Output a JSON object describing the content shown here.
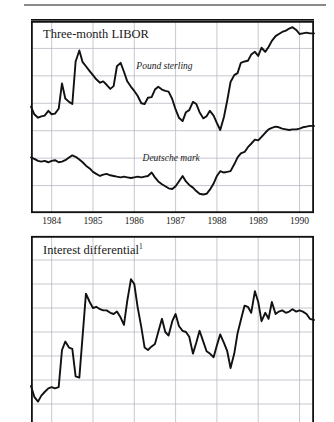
{
  "figure": {
    "rule_color": "#8a8a8a",
    "line_color": "#111111",
    "grid_color": "#b9b9c4",
    "frame_color": "#111111"
  },
  "chart_data": [
    {
      "type": "line",
      "title": "Three-month LIBOR",
      "xlabel": "",
      "ylabel": "",
      "grid": true,
      "legend_position": "inline-annotation",
      "ylim": [
        2,
        16
      ],
      "yticks": [
        2,
        4,
        6,
        8,
        10,
        12,
        14,
        16
      ],
      "ytick_labels": [
        "2",
        "4",
        "6",
        "8",
        "10",
        "12",
        "14",
        "16"
      ],
      "xlim": [
        1983.5,
        1990.35
      ],
      "xticks": [
        1984,
        1985,
        1986,
        1987,
        1988,
        1989,
        1990
      ],
      "xtick_labels": [
        "1984",
        "1985",
        "1986",
        "1987",
        "1988",
        "1989",
        "1990"
      ],
      "annotations": [
        {
          "text": "Pound sterling",
          "x": 1986.05,
          "y": 12.55
        },
        {
          "text": "Deutsche mark",
          "x": 1986.2,
          "y": 5.9
        }
      ],
      "series": [
        {
          "name": "Pound sterling",
          "x": [
            1983.5,
            1983.58,
            1983.67,
            1983.75,
            1983.83,
            1983.92,
            1984.0,
            1984.08,
            1984.17,
            1984.25,
            1984.33,
            1984.42,
            1984.5,
            1984.58,
            1984.67,
            1984.75,
            1984.83,
            1984.92,
            1985.0,
            1985.08,
            1985.17,
            1985.25,
            1985.33,
            1985.42,
            1985.5,
            1985.58,
            1985.67,
            1985.75,
            1985.83,
            1985.92,
            1986.0,
            1986.08,
            1986.17,
            1986.25,
            1986.33,
            1986.42,
            1986.5,
            1986.58,
            1986.67,
            1986.75,
            1986.83,
            1986.92,
            1987.0,
            1987.08,
            1987.17,
            1987.25,
            1987.33,
            1987.42,
            1987.5,
            1987.58,
            1987.67,
            1987.75,
            1987.83,
            1987.92,
            1988.0,
            1988.08,
            1988.17,
            1988.25,
            1988.33,
            1988.42,
            1988.5,
            1988.58,
            1988.67,
            1988.75,
            1988.83,
            1988.92,
            1989.0,
            1989.08,
            1989.17,
            1989.25,
            1989.33,
            1989.42,
            1989.5,
            1989.58,
            1989.67,
            1989.75,
            1989.83,
            1989.92,
            1990.0,
            1990.08,
            1990.17,
            1990.25,
            1990.35
          ],
          "y": [
            9.75,
            9.2,
            8.95,
            9.05,
            9.1,
            9.45,
            9.2,
            9.25,
            9.6,
            11.45,
            10.35,
            10.1,
            9.95,
            13.05,
            13.85,
            13.0,
            12.7,
            12.35,
            12.05,
            11.75,
            11.5,
            11.6,
            11.35,
            11.05,
            11.25,
            12.7,
            12.95,
            12.3,
            11.6,
            11.2,
            10.9,
            10.55,
            10.0,
            9.95,
            10.4,
            10.45,
            11.0,
            11.2,
            11.0,
            10.9,
            10.85,
            10.3,
            9.55,
            8.95,
            8.7,
            9.35,
            9.5,
            10.1,
            9.95,
            9.35,
            8.9,
            9.05,
            9.45,
            9.1,
            8.55,
            8.05,
            9.0,
            10.2,
            11.55,
            12.05,
            12.2,
            12.95,
            13.05,
            13.1,
            13.55,
            13.75,
            13.45,
            14.05,
            13.75,
            14.1,
            14.55,
            14.9,
            15.05,
            15.2,
            15.3,
            15.45,
            15.55,
            15.35,
            15.05,
            15.1,
            15.15,
            15.1,
            15.1
          ]
        },
        {
          "name": "Deutsche mark",
          "x": [
            1983.5,
            1983.58,
            1983.67,
            1983.75,
            1983.83,
            1983.92,
            1984.0,
            1984.08,
            1984.17,
            1984.25,
            1984.33,
            1984.42,
            1984.5,
            1984.58,
            1984.67,
            1984.75,
            1984.83,
            1984.92,
            1985.0,
            1985.08,
            1985.17,
            1985.25,
            1985.33,
            1985.42,
            1985.5,
            1985.58,
            1985.67,
            1985.75,
            1985.83,
            1985.92,
            1986.0,
            1986.08,
            1986.17,
            1986.25,
            1986.33,
            1986.42,
            1986.5,
            1986.58,
            1986.67,
            1986.75,
            1986.83,
            1986.92,
            1987.0,
            1987.08,
            1987.17,
            1987.25,
            1987.33,
            1987.42,
            1987.5,
            1987.58,
            1987.67,
            1987.75,
            1987.83,
            1987.92,
            1988.0,
            1988.08,
            1988.17,
            1988.25,
            1988.33,
            1988.42,
            1988.5,
            1988.58,
            1988.67,
            1988.75,
            1988.83,
            1988.92,
            1989.0,
            1989.08,
            1989.17,
            1989.25,
            1989.33,
            1989.42,
            1989.5,
            1989.58,
            1989.67,
            1989.75,
            1989.83,
            1989.92,
            1990.0,
            1990.08,
            1990.17,
            1990.25,
            1990.35
          ],
          "y": [
            6.05,
            5.95,
            5.8,
            5.75,
            5.8,
            5.7,
            5.8,
            5.85,
            5.7,
            5.75,
            5.85,
            6.05,
            6.2,
            6.1,
            5.9,
            5.7,
            5.45,
            5.25,
            5.0,
            4.85,
            4.7,
            4.8,
            4.85,
            4.75,
            4.7,
            4.65,
            4.6,
            4.65,
            4.6,
            4.55,
            4.6,
            4.65,
            4.6,
            4.65,
            4.7,
            4.95,
            4.6,
            4.3,
            4.1,
            3.95,
            3.8,
            3.75,
            3.95,
            4.3,
            4.7,
            4.3,
            4.05,
            3.85,
            3.6,
            3.4,
            3.35,
            3.4,
            3.7,
            4.15,
            4.7,
            5.05,
            4.95,
            5.0,
            5.05,
            5.55,
            6.05,
            6.35,
            6.45,
            6.8,
            7.05,
            7.35,
            7.3,
            7.55,
            7.85,
            8.1,
            8.2,
            8.3,
            8.25,
            8.15,
            8.1,
            8.05,
            8.1,
            8.1,
            8.15,
            8.25,
            8.3,
            8.35,
            8.35
          ]
        }
      ]
    },
    {
      "type": "line",
      "title": "Interest differential",
      "title_superscript": "1",
      "xlabel": "",
      "ylabel": "",
      "grid": true,
      "ylim": [
        2,
        10
      ],
      "yticks": [
        3,
        4,
        5,
        6,
        7,
        8,
        9,
        10
      ],
      "ytick_labels": [
        "3",
        "4",
        "5",
        "6",
        "7",
        "8",
        "9",
        "10"
      ],
      "xlim": [
        1983.5,
        1990.35
      ],
      "xticks": [
        1984,
        1985,
        1986,
        1987,
        1988,
        1989,
        1990
      ],
      "xtick_labels": [],
      "note": "bottom of panel is cropped by the screenshot edge",
      "series": [
        {
          "name": "Interest differential",
          "x": [
            1983.5,
            1983.58,
            1983.67,
            1983.75,
            1983.83,
            1983.92,
            1984.0,
            1984.08,
            1984.17,
            1984.25,
            1984.33,
            1984.42,
            1984.5,
            1984.58,
            1984.67,
            1984.75,
            1984.83,
            1984.92,
            1985.0,
            1985.08,
            1985.17,
            1985.25,
            1985.33,
            1985.42,
            1985.5,
            1985.58,
            1985.67,
            1985.75,
            1985.83,
            1985.92,
            1986.0,
            1986.08,
            1986.17,
            1986.25,
            1986.33,
            1986.42,
            1986.5,
            1986.58,
            1986.67,
            1986.75,
            1986.83,
            1986.92,
            1987.0,
            1987.08,
            1987.17,
            1987.25,
            1987.33,
            1987.42,
            1987.5,
            1987.58,
            1987.67,
            1987.75,
            1987.83,
            1987.92,
            1988.0,
            1988.08,
            1988.17,
            1988.25,
            1988.33,
            1988.42,
            1988.5,
            1988.58,
            1988.67,
            1988.75,
            1988.83,
            1988.92,
            1989.0,
            1989.08,
            1989.17,
            1989.25,
            1989.33,
            1989.42,
            1989.5,
            1989.58,
            1989.67,
            1989.75,
            1989.83,
            1989.92,
            1990.0,
            1990.08,
            1990.17,
            1990.25,
            1990.35
          ],
          "y": [
            3.75,
            3.3,
            3.1,
            3.35,
            3.5,
            3.65,
            3.7,
            3.65,
            3.7,
            5.25,
            5.6,
            5.35,
            5.3,
            4.15,
            4.1,
            5.85,
            7.6,
            7.25,
            7.0,
            7.05,
            6.95,
            6.9,
            6.9,
            6.8,
            6.75,
            6.85,
            6.6,
            6.3,
            7.3,
            8.2,
            8.0,
            7.05,
            6.2,
            5.35,
            5.25,
            5.4,
            5.5,
            6.0,
            6.55,
            6.0,
            5.85,
            6.45,
            6.75,
            6.25,
            6.05,
            6.0,
            5.8,
            5.1,
            5.55,
            6.05,
            5.6,
            5.2,
            5.1,
            4.95,
            5.45,
            5.9,
            5.55,
            5.2,
            4.5,
            5.1,
            5.95,
            6.5,
            7.1,
            7.05,
            6.8,
            7.7,
            7.25,
            6.45,
            6.8,
            6.55,
            7.25,
            6.75,
            6.85,
            6.9,
            6.8,
            6.85,
            6.95,
            6.85,
            6.9,
            6.85,
            6.75,
            6.55,
            6.5
          ]
        }
      ]
    }
  ]
}
